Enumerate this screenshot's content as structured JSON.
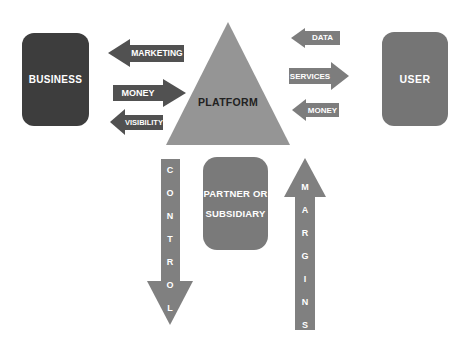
{
  "diagram": {
    "background": "#ffffff",
    "business_box": {
      "label": "BUSINESS",
      "fill": "#3d3d3d",
      "text_color": "#ffffff"
    },
    "user_box": {
      "label": "USER",
      "fill": "#757575",
      "text_color": "#ffffff"
    },
    "platform_triangle": {
      "label": "PLATFORM",
      "fill": "#959595",
      "text_color": "#222222"
    },
    "partner_box": {
      "label_line1": "PARTNER OR",
      "label_line2": "SUBSIDIARY",
      "fill": "#7a7a7a",
      "text_color": "#ffffff"
    },
    "business_platform_arrows": [
      {
        "label": "MARKETING",
        "direction": "left",
        "fill": "#515151"
      },
      {
        "label": "MONEY",
        "direction": "right",
        "fill": "#515151"
      },
      {
        "label": "VISIBILITY",
        "direction": "left",
        "fill": "#515151"
      }
    ],
    "user_platform_arrows": [
      {
        "label": "DATA",
        "direction": "left",
        "fill": "#7d7d7d"
      },
      {
        "label": "SERVICES",
        "direction": "right",
        "fill": "#7d7d7d"
      },
      {
        "label": "MONEY",
        "direction": "left",
        "fill": "#7d7d7d"
      }
    ],
    "control_arrow": {
      "label": "CONTROL",
      "direction": "down",
      "fill": "#808080"
    },
    "margins_arrow": {
      "label": "MARGINS",
      "direction": "up",
      "fill": "#808080"
    }
  }
}
